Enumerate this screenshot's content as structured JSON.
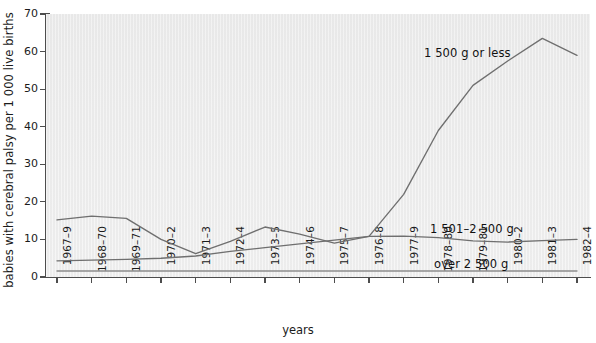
{
  "chart_data": {
    "type": "line",
    "title": "",
    "xlabel": "years",
    "ylabel": "babies with cerebral palsy per 1 000 live births",
    "ylim": [
      0,
      70
    ],
    "yticks": [
      0,
      10,
      20,
      30,
      40,
      50,
      60,
      70
    ],
    "grid": false,
    "legend_position": "inline-annotations",
    "categories": [
      "1967–9",
      "1968–70",
      "1969–71",
      "1970–2",
      "1971–3",
      "1972–4",
      "1973–5",
      "1974–6",
      "1975–7",
      "1976–8",
      "1977–9",
      "1978–80",
      "1979–81",
      "1980–2",
      "1981–3",
      "1982–4"
    ],
    "series": [
      {
        "name": "1 500 g or less",
        "color": "#6f6f6f",
        "values": [
          15.2,
          16.2,
          15.6,
          10.0,
          6.2,
          9.5,
          13.3,
          11.4,
          9.0,
          10.8,
          22.0,
          39.0,
          51.0,
          57.5,
          63.5,
          59.0
        ]
      },
      {
        "name": "1 501–2 500 g",
        "color": "#6f6f6f",
        "values": [
          4.3,
          4.5,
          4.7,
          5.0,
          5.6,
          6.8,
          7.8,
          8.8,
          9.8,
          10.8,
          10.9,
          10.5,
          9.6,
          9.3,
          9.7,
          10.0
        ]
      },
      {
        "name": "over 2 500 g",
        "color": "#8c8c8c",
        "values": [
          1.6,
          1.6,
          1.6,
          1.6,
          1.6,
          1.6,
          1.6,
          1.6,
          1.6,
          1.6,
          1.6,
          1.6,
          1.6,
          1.6,
          1.6,
          1.6
        ]
      }
    ],
    "annotations": [
      {
        "text": "1 500 g or less",
        "series": 0
      },
      {
        "text": "1 501–2 500 g",
        "series": 1
      },
      {
        "text": "over 2 500 g",
        "series": 2
      }
    ]
  },
  "colors": {
    "plot_background": "#ececec",
    "axis": "#4d4d4d",
    "text": "#1b1b1b",
    "line": "#6f6f6f"
  }
}
